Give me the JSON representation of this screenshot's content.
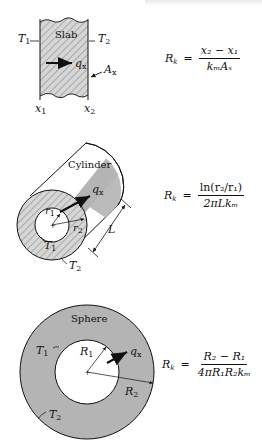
{
  "header": {
    "cropped_text": ""
  },
  "slab": {
    "title": "Slab",
    "t1": "T",
    "t1_sub": "1",
    "t2": "T",
    "t2_sub": "2",
    "q": "q",
    "q_sub": "x",
    "area": "A",
    "area_sub": "x",
    "x1": "x",
    "x1_sub": "1",
    "x2": "x",
    "x2_sub": "2",
    "formula": {
      "lhs": "R",
      "lhs_sub": "k",
      "eq": "=",
      "numerator": "x₂ − x₁",
      "denominator": "kₘAₓ"
    }
  },
  "cylinder": {
    "title": "Cylinder",
    "q": "q",
    "q_sub": "x",
    "r1": "r",
    "r1_sub": "1",
    "r2": "r",
    "r2_sub": "2",
    "length": "L",
    "t1": "T",
    "t1_sub": "1",
    "t2": "T",
    "t2_sub": "2",
    "formula": {
      "lhs": "R",
      "lhs_sub": "k",
      "eq": "=",
      "numerator": "ln(r₂/r₁)",
      "denominator": "2πLkₘ"
    }
  },
  "sphere": {
    "title": "Sphere",
    "q": "q",
    "q_sub": "x",
    "r1": "R",
    "r1_sub": "1",
    "r2": "R",
    "r2_sub": "2",
    "t1": "T",
    "t1_sub": "1",
    "t2": "T",
    "t2_sub": "2",
    "formula": {
      "lhs": "R",
      "lhs_sub": "k",
      "eq": "=",
      "numerator": "R₂ − R₁",
      "denominator": "4πR₁R₂kₘ"
    }
  },
  "colors": {
    "fill_gray": "#b4b4b4",
    "hatch_gray": "#8a8a8a",
    "line": "#111111",
    "background": "#ffffff"
  }
}
